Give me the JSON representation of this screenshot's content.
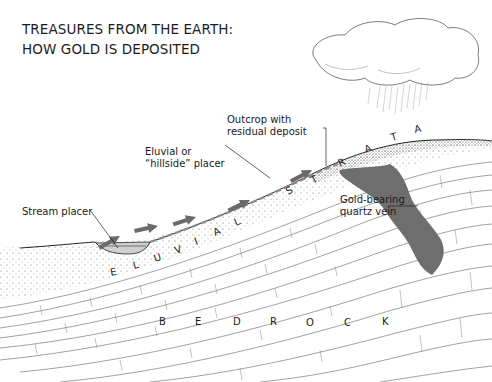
{
  "title": {
    "line1": "TREASURES FROM THE EARTH:",
    "line2": "HOW GOLD IS DEPOSITED"
  },
  "labels": {
    "outcrop": {
      "line1": "Outcrop with",
      "line2": "residual deposit"
    },
    "eluvial": {
      "line1": "Eluvial or",
      "line2": "“hillside” placer"
    },
    "stream": "Stream placer",
    "quartz": {
      "line1": "Gold-bearing",
      "line2": "quartz vein"
    }
  },
  "strata_words": {
    "eluvial": [
      "E",
      "L",
      "U",
      "V",
      "I",
      "A",
      "L"
    ],
    "strata": [
      "S",
      "T",
      "R",
      "A",
      "T",
      "A"
    ],
    "bedrock": [
      "B",
      "E",
      "D",
      "R",
      "O",
      "C",
      "K"
    ]
  },
  "colors": {
    "ink": "#1a1a1a",
    "vein": "#6e6e6e",
    "arrow": "#6a6a6a",
    "soil_dot": "#555555",
    "line": "#3a3a3a"
  },
  "elements": {
    "cloud": "rain-cloud",
    "arrows": 5
  }
}
